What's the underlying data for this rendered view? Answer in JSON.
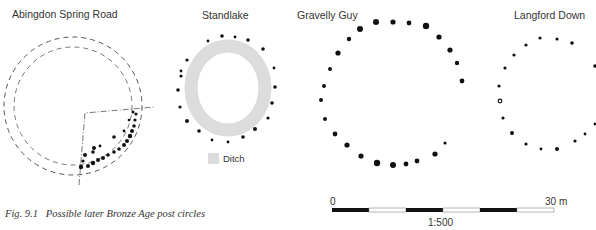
{
  "sites": [
    {
      "name": "Abingdon Spring Road"
    },
    {
      "name": "Standlake"
    },
    {
      "name": "Gravelly Guy"
    },
    {
      "name": "Langford Down"
    }
  ],
  "legend": {
    "ditch_label": "Ditch",
    "ditch_color": "#dcdcdc"
  },
  "scale_bar": {
    "start_label": "0",
    "end_label": "30 m",
    "ratio": "1:500",
    "segments": 6
  },
  "caption": {
    "figure": "Fig. 9.1",
    "text": "Possible later Bronze Age post circles"
  },
  "colors": {
    "post": "#111111",
    "dashed_line": "#555555",
    "text": "#333333"
  }
}
